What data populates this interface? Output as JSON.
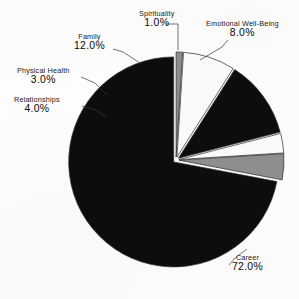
{
  "chart_data": {
    "type": "pie",
    "title": "",
    "subtitle": "",
    "xlabel": "",
    "ylabel": "",
    "legend_position": "none",
    "grid": false,
    "labels_show_percent": true,
    "start_angle_deg": 90,
    "direction": "clockwise",
    "categories": [
      "Spirituality",
      "Emotional Well-Being",
      "Career",
      "Family",
      "Physical Health",
      "Relationships"
    ],
    "values": [
      1.0,
      8.0,
      72.0,
      12.0,
      3.0,
      4.0
    ],
    "value_labels": [
      "1.0%",
      "8.0%",
      "72.0%",
      "12.0%",
      "3.0%",
      "4.0%"
    ],
    "colors": [
      "#8d8d8d",
      "#fbfbfb",
      "#0d0d0d",
      "#0d0d0d",
      "#fbfbfb",
      "#8f8f8f"
    ],
    "total": 100.0,
    "slices": [
      {
        "name": "Spirituality",
        "value": 1.0,
        "value_label": "1.0%",
        "color": "#8d8d8d",
        "label_x": 139,
        "label_y": 10,
        "leader": "M 166 24 L 178 24 L 178 50"
      },
      {
        "name": "Emotional Well-Being",
        "value": 8.0,
        "value_label": "8.0%",
        "color": "#fbfbfb",
        "label_x": 206,
        "label_y": 20,
        "leader": "M 228 40 L 222 47 L 200 60"
      },
      {
        "name": "Family",
        "value": 12.0,
        "value_label": "12.0%",
        "color": "#0d0d0d",
        "label_x": 74,
        "label_y": 33,
        "leader": "M 113 49 L 123 52 L 140 63"
      },
      {
        "name": "Physical Health",
        "value": 3.0,
        "value_label": "3.0%",
        "color": "#fbfbfb",
        "label_x": 17,
        "label_y": 67,
        "leader": "M 81 77 L 95 83 L 107 95"
      },
      {
        "name": "Relationships",
        "value": 4.0,
        "value_label": "4.0%",
        "color": "#8f8f8f",
        "label_x": 14,
        "label_y": 96,
        "leader": "M 82 106 L 96 110 L 106 117"
      },
      {
        "name": "Career",
        "value": 72.0,
        "value_label": "72.0%",
        "color": "#0d0d0d",
        "label_x": 232,
        "label_y": 254,
        "leader": "M 229 265 L 235 258 L 247 249"
      }
    ],
    "geometry": {
      "center_x": 176,
      "center_y": 160,
      "radius": 105,
      "explode_gap_px": 3
    }
  },
  "page": {
    "background_color": "#fdfdfd",
    "text_color": "#0d0d0d"
  }
}
